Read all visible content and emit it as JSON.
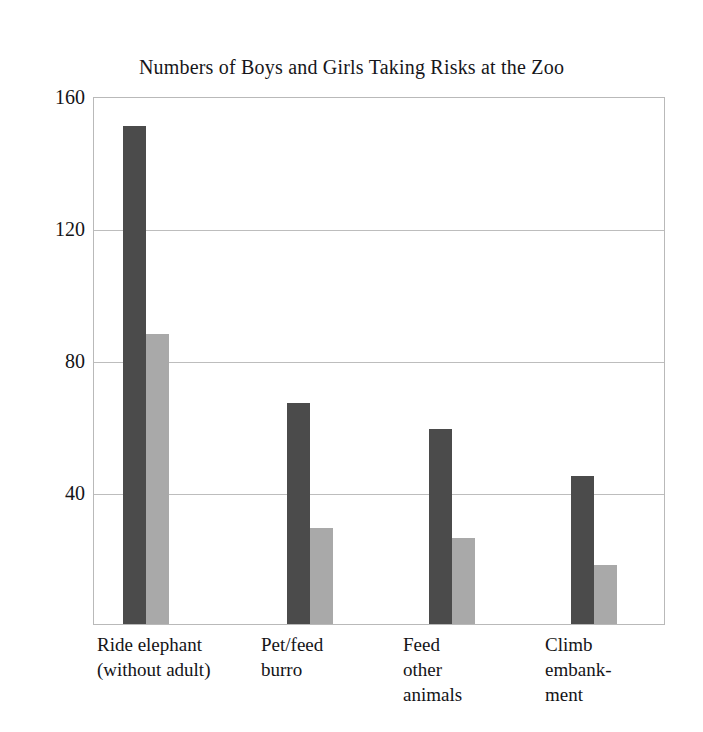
{
  "chart_data": {
    "type": "bar",
    "title": "Numbers of Boys and Girls Taking Risks at the Zoo",
    "xlabel": "",
    "ylabel": "",
    "grid": true,
    "legend_position": "none",
    "ylim": [
      0,
      160
    ],
    "yticks": [
      40,
      80,
      120,
      160
    ],
    "ytick_labels": [
      "40",
      "80",
      "120",
      "160"
    ],
    "categories": [
      "Ride elephant\n(without adult)",
      "Pet/feed\nburro",
      "Feed\nother\nanimals",
      "Climb\nembank-\nment"
    ],
    "series": [
      {
        "name": "Boys",
        "color": "#4b4b4b",
        "values": [
          151,
          67,
          59,
          45
        ]
      },
      {
        "name": "Girls",
        "color": "#a9a9a9",
        "values": [
          88,
          29,
          26,
          18
        ]
      }
    ]
  }
}
